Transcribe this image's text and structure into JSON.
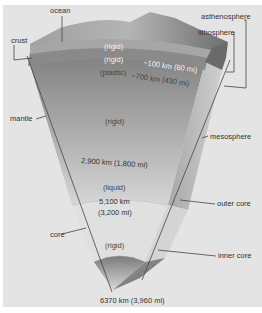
{
  "diagram": {
    "left_labels": {
      "ocean": "ocean",
      "crust": "crust",
      "mantle": "mantle",
      "core": "core"
    },
    "right_labels": {
      "asthenosphere": "asthenosphere",
      "lithosphere": "lithosphere",
      "mesosphere": "mesosphere",
      "outer_core": "outer core",
      "inner_core": "inner core"
    },
    "layers": {
      "lithosphere_state": "(rigid)",
      "upper_rigid_state": "(rigid)",
      "asthenosphere_state": "(plastic)",
      "mesosphere_state": "(rigid)",
      "outer_core_state": "(liquid)",
      "inner_core_state": "(rigid)"
    },
    "depths": {
      "lithosphere_depth": "~100 km (60 mi)",
      "asthenosphere_depth": "~700 km (430 mi)",
      "mantle_depth": "2,900 km (1,800 mi)",
      "outer_core_depth_km": "5,100 km",
      "outer_core_depth_mi": "(3,200 mi)",
      "center_depth": "6370 km (3,960 mi)"
    },
    "colors": {
      "background": "#e4e4e4",
      "surface": "#9a9a9a",
      "lithosphere": "#8c8c8c",
      "mantle_top": "#7a7a7a",
      "mantle_bottom": "#d0d0d0",
      "outer_core": "#dedede",
      "inner_core": "#8a8a8a"
    }
  }
}
